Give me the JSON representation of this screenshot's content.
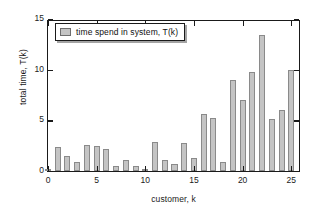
{
  "chart_data": {
    "type": "bar",
    "title": "",
    "xlabel": "customer, k",
    "ylabel": "total time, T(k)",
    "xlim": [
      0,
      26
    ],
    "ylim": [
      0,
      15
    ],
    "xticks": [
      0,
      5,
      10,
      15,
      20,
      25
    ],
    "yticks": [
      0,
      5,
      10,
      15
    ],
    "grid": false,
    "legend_position": "upper-left",
    "legend": [
      "time spend in system, T(k)"
    ],
    "bar_color": "#c4c4c4",
    "bar_edge_color": "#8a8a8a",
    "axis_color": "#1a1a1a",
    "categories": [
      0,
      1,
      2,
      3,
      4,
      5,
      6,
      7,
      8,
      9,
      10,
      11,
      12,
      13,
      14,
      15,
      16,
      17,
      18,
      19,
      20,
      21,
      22,
      23,
      24,
      25
    ],
    "series": [
      {
        "name": "time spend in system, T(k)",
        "values": [
          0.1,
          2.4,
          1.5,
          0.9,
          2.6,
          2.5,
          2.2,
          0.45,
          1.1,
          0.5,
          0.2,
          2.9,
          1.1,
          0.65,
          2.8,
          1.3,
          5.6,
          5.2,
          0.85,
          9.0,
          7.0,
          9.8,
          13.4,
          5.1,
          6.0,
          10.0
        ]
      }
    ]
  },
  "legend": {
    "entry_label": "time spend in system, T(k)"
  },
  "axes": {
    "x_label": "customer, k",
    "y_label": "total time, T(k)",
    "x_tick_labels": [
      "0",
      "5",
      "10",
      "15",
      "20",
      "25"
    ],
    "y_tick_labels": [
      "0",
      "5",
      "10",
      "15"
    ]
  }
}
